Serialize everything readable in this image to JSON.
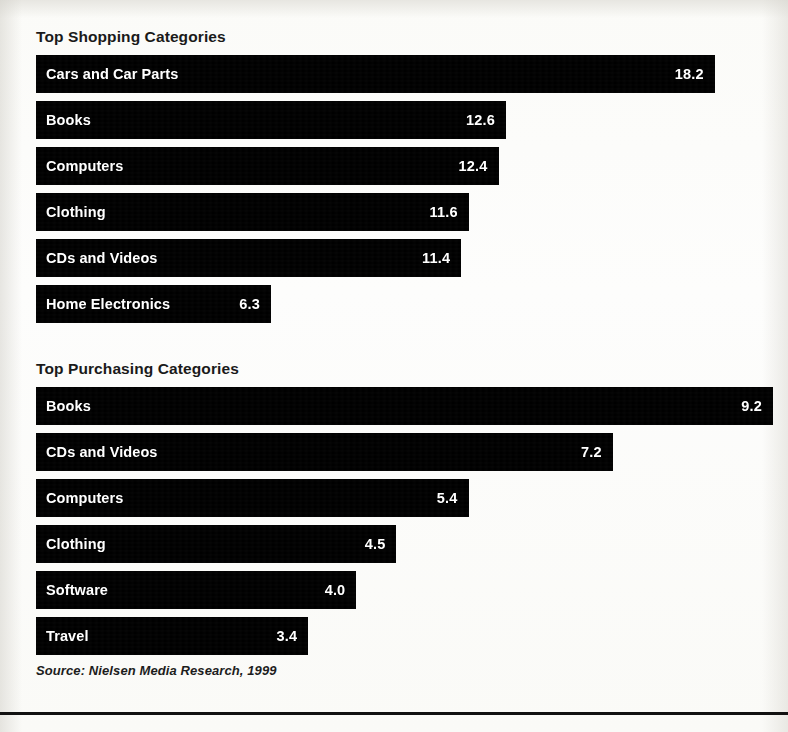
{
  "shopping": {
    "title": "Top Shopping Categories",
    "rows": [
      {
        "label": "Cars and Car Parts",
        "value": "18.2"
      },
      {
        "label": "Books",
        "value": "12.6"
      },
      {
        "label": "Computers",
        "value": "12.4"
      },
      {
        "label": "Clothing",
        "value": "11.6"
      },
      {
        "label": "CDs and Videos",
        "value": "11.4"
      },
      {
        "label": "Home Electronics",
        "value": "6.3"
      }
    ]
  },
  "purchasing": {
    "title": "Top Purchasing Categories",
    "rows": [
      {
        "label": "Books",
        "value": "9.2"
      },
      {
        "label": "CDs and Videos",
        "value": "7.2"
      },
      {
        "label": "Computers",
        "value": "5.4"
      },
      {
        "label": "Clothing",
        "value": "4.5"
      },
      {
        "label": "Software",
        "value": "4.0"
      },
      {
        "label": "Travel",
        "value": "3.4"
      }
    ]
  },
  "source": "Source: Nielsen Media Research, 1999",
  "colors": {
    "bar": "#000000",
    "bar_text": "#ffffff",
    "title_text": "#1a1a1a",
    "page_background": "#fdfdfb"
  },
  "chart_data": [
    {
      "type": "bar",
      "orientation": "horizontal",
      "title": "Top Shopping Categories",
      "xlabel": "",
      "ylabel": "",
      "categories": [
        "Cars and Car Parts",
        "Books",
        "Computers",
        "Clothing",
        "CDs and Videos",
        "Home Electronics"
      ],
      "values": [
        18.2,
        12.6,
        12.4,
        11.6,
        11.4,
        6.3
      ],
      "data_labels": [
        "18.2",
        "12.6",
        "12.4",
        "11.6",
        "11.4",
        "6.3"
      ],
      "xlim": [
        0,
        18.2
      ],
      "grid": false,
      "legend": false,
      "px_per_unit": 37.3,
      "bar_origin_px": 36
    },
    {
      "type": "bar",
      "orientation": "horizontal",
      "title": "Top Purchasing Categories",
      "xlabel": "",
      "ylabel": "",
      "categories": [
        "Books",
        "CDs and Videos",
        "Computers",
        "Clothing",
        "Software",
        "Travel"
      ],
      "values": [
        9.2,
        7.2,
        5.4,
        4.5,
        4.0,
        3.4
      ],
      "data_labels": [
        "9.2",
        "7.2",
        "5.4",
        "4.5",
        "4.0",
        "3.4"
      ],
      "xlim": [
        0,
        9.2
      ],
      "grid": false,
      "legend": false,
      "px_per_unit": 80.1,
      "bar_origin_px": 36
    }
  ]
}
